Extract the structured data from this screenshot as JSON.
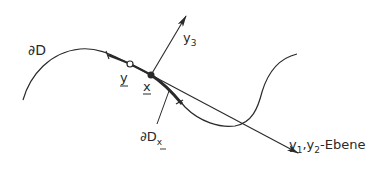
{
  "diagram": {
    "labels": {
      "boundary": "∂D",
      "point_x": "x",
      "point_y": "y",
      "axis_y3": "y",
      "axis_y3_sub": "3",
      "plane_y1": "y",
      "plane_y1_sub": "1",
      "plane_sep": ",",
      "plane_y2": "y",
      "plane_y2_sub": "2",
      "plane_suffix": "-Ebene",
      "local_boundary": "∂D",
      "local_boundary_sub": "x"
    },
    "colors": {
      "ink": "#2a2a2a",
      "background": "#ffffff"
    }
  }
}
